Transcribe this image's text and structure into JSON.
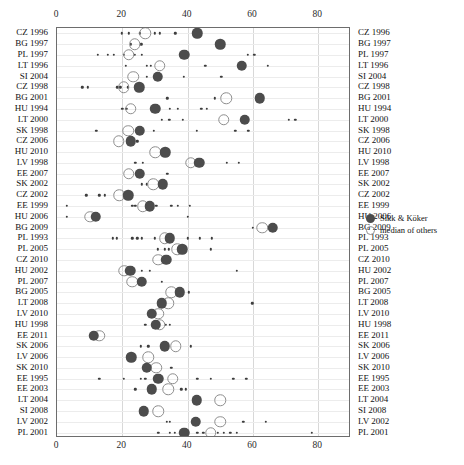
{
  "chart_data": {
    "type": "scatter",
    "title": "",
    "xlabel": "",
    "ylabel": "",
    "xlim": [
      0,
      90
    ],
    "xticks": [
      0,
      20,
      40,
      60,
      80
    ],
    "xtick_labels": [
      "0",
      "20",
      "40",
      "60",
      "80"
    ],
    "grid": true,
    "axis_top": true,
    "axis_bottom": true,
    "labels_left": true,
    "labels_right": true,
    "legend": {
      "position": "right",
      "entries": [
        {
          "label": "Sikk & Köker",
          "marker": "filled-circle",
          "color": "#4c4c4c"
        },
        {
          "label": "median of others",
          "marker": "open-circle",
          "color": "#8e8e8e"
        }
      ]
    },
    "series_names": [
      "Sikk & Köker",
      "median of others",
      "others"
    ],
    "categories": [
      "CZ 1996",
      "BG 1997",
      "PL 1997",
      "LT 1996",
      "SI 2004",
      "CZ 1998",
      "BG 2001",
      "HU 1994",
      "LT 2000",
      "SK 1998",
      "CZ 2006",
      "HU 2010",
      "LV 1998",
      "EE 2007",
      "SK 2002",
      "CZ 2002",
      "EE 1999",
      "HU 2006",
      "BG 2009",
      "PL 1993",
      "PL 2005",
      "CZ 2010",
      "HU 2002",
      "PL 2007",
      "BG 2005",
      "LT 2008",
      "LV 2010",
      "HU 1998",
      "EE 2011",
      "SK 2006",
      "LV 2006",
      "SK 2010",
      "EE 1995",
      "EE 2003",
      "LT 2004",
      "SI 2008",
      "LV 2002",
      "PL 2001"
    ],
    "rows": [
      {
        "category": "CZ 1996",
        "main": 43.0,
        "median": 27.0,
        "others": [
          19.8,
          22.0,
          25.4,
          30.0,
          31.4,
          36.2
        ]
      },
      {
        "category": "BG 1997",
        "main": 50.0,
        "median": 23.8,
        "others": [
          22.5,
          25.8
        ]
      },
      {
        "category": "PL 1997",
        "main": 39.0,
        "median": 22.0,
        "others": [
          12.5,
          15.6,
          17.4,
          20.5,
          23.8,
          26.0,
          58.4,
          60.4
        ]
      },
      {
        "category": "LT 1996",
        "main": 56.5,
        "median": 31.5,
        "others": [
          21.0,
          27.4,
          28.8,
          45.4,
          57.5,
          64.5
        ]
      },
      {
        "category": "SI 2004",
        "main": 30.8,
        "median": 23.4,
        "others": [
          27.5,
          38.8,
          50.3
        ]
      },
      {
        "category": "CZ 1998",
        "main": 25.2,
        "median": 20.5,
        "others": [
          7.8,
          9.5,
          18.5,
          19.4,
          21.6
        ]
      },
      {
        "category": "BG 2001",
        "main": 62.0,
        "median": 51.8,
        "others": [
          33.8,
          48.4
        ]
      },
      {
        "category": "HU 1994",
        "main": 30.0,
        "median": 22.6,
        "others": [
          20.0,
          21.2,
          34.6,
          37.0,
          44.2,
          45.8
        ]
      },
      {
        "category": "LT 2000",
        "main": 57.5,
        "median": 51.0,
        "others": [
          32.0,
          34.4,
          38.5,
          71.0,
          73.0
        ]
      },
      {
        "category": "SK 1998",
        "main": 25.4,
        "median": 21.8,
        "others": [
          12.0,
          29.6,
          42.8,
          54.6,
          58.6
        ]
      },
      {
        "category": "CZ 2006",
        "main": 22.6,
        "median": 18.9,
        "others": [
          24.6
        ]
      },
      {
        "category": "HU 2010",
        "main": 33.2,
        "median": 30.0,
        "others": []
      },
      {
        "category": "LV 1998",
        "main": 43.5,
        "median": 41.0,
        "others": [
          24.0,
          26.2,
          52.0,
          55.6
        ]
      },
      {
        "category": "EE 2007",
        "main": 25.4,
        "median": 22.0,
        "others": [
          33.8
        ]
      },
      {
        "category": "SK 2002",
        "main": 32.4,
        "median": 29.4,
        "others": [
          26.0,
          27.5
        ]
      },
      {
        "category": "CZ 2002",
        "main": 21.8,
        "median": 19.0,
        "others": [
          9.0,
          13.0,
          14.6
        ]
      },
      {
        "category": "EE 1999",
        "main": 28.4,
        "median": 26.2,
        "others": [
          3.0,
          23.0,
          24.0,
          30.4,
          35.0,
          37.0,
          40.6
        ]
      },
      {
        "category": "HU 2006",
        "main": 11.8,
        "median": 10.2,
        "others": [
          3.0,
          40.0
        ]
      },
      {
        "category": "BG 2009",
        "main": 66.0,
        "median": 62.8,
        "others": [
          60.0
        ]
      },
      {
        "category": "PL 1993",
        "main": 34.5,
        "median": 33.0,
        "others": [
          17.0,
          18.4,
          23.0,
          24.6,
          26.0,
          30.0,
          40.0,
          43.8,
          47.4
        ]
      },
      {
        "category": "PL 2005",
        "main": 38.4,
        "median": 36.8,
        "others": [
          30.8,
          33.0,
          34.2,
          47.0
        ]
      },
      {
        "category": "CZ 2010",
        "main": 33.4,
        "median": 31.0,
        "others": []
      },
      {
        "category": "HU 2002",
        "main": 22.4,
        "median": 20.6,
        "others": [
          26.0,
          28.5,
          55.0
        ]
      },
      {
        "category": "PL 2007",
        "main": 26.0,
        "median": 23.0,
        "others": [
          32.0
        ]
      },
      {
        "category": "BG 2005",
        "main": 37.5,
        "median": 35.0,
        "others": [
          40.4
        ]
      },
      {
        "category": "LT 2008",
        "main": 32.0,
        "median": 34.0,
        "others": [
          59.8
        ]
      },
      {
        "category": "LV 2010",
        "main": 29.0,
        "median": 31.0,
        "others": []
      },
      {
        "category": "HU 1998",
        "main": 30.2,
        "median": 31.4,
        "others": [
          27.0,
          33.4,
          34.6
        ]
      },
      {
        "category": "EE 2011",
        "main": 11.2,
        "median": 13.0,
        "others": []
      },
      {
        "category": "SK 2006",
        "main": 33.0,
        "median": 36.4,
        "others": [
          25.6,
          28.0,
          41.0
        ]
      },
      {
        "category": "LV 2006",
        "main": 22.8,
        "median": 28.0,
        "others": []
      },
      {
        "category": "SK 2010",
        "main": 27.5,
        "median": 30.4,
        "others": [
          35.0
        ]
      },
      {
        "category": "EE 1995",
        "main": 31.0,
        "median": 35.4,
        "others": [
          13.0,
          20.4,
          25.6,
          27.0,
          43.0,
          47.0,
          54.0,
          58.0
        ]
      },
      {
        "category": "EE 2003",
        "main": 29.0,
        "median": 34.0,
        "others": [
          24.0,
          38.0,
          39.4
        ]
      },
      {
        "category": "LT 2004",
        "main": 42.8,
        "median": 50.0,
        "others": []
      },
      {
        "category": "SI 2008",
        "main": 26.6,
        "median": 31.0,
        "others": []
      },
      {
        "category": "LV 2002",
        "main": 42.5,
        "median": 50.0,
        "others": [
          33.6,
          34.6,
          57.0,
          64.0
        ]
      },
      {
        "category": "PL 2001",
        "main": 39.0,
        "median": 47.0,
        "others": [
          31.0,
          34.6,
          36.0,
          43.0,
          44.8,
          49.2,
          51.0,
          53.0,
          55.0,
          78.0
        ]
      }
    ]
  }
}
